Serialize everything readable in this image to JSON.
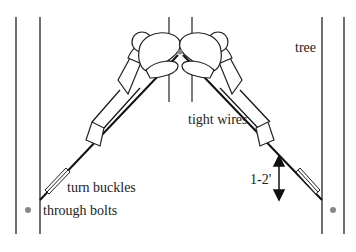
{
  "diagram": {
    "labels": {
      "tree": "tree",
      "tight_wires": "tight wires",
      "turn_buckles": "turn buckles",
      "through_bolts": "through bolts",
      "distance": "1-2'"
    },
    "colors": {
      "line": "#222222",
      "bolt": "#888888",
      "background": "#ffffff"
    }
  }
}
